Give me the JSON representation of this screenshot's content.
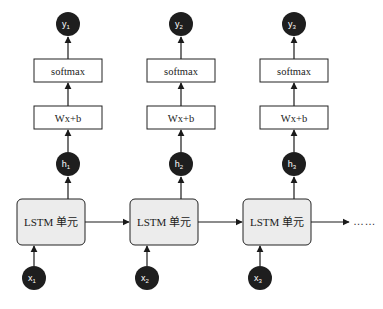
{
  "diagram": {
    "type": "unrolled-lstm-sequence",
    "timesteps": [
      {
        "input": {
          "label": "x",
          "sub": "1"
        },
        "cell": {
          "label": "LSTM 单元"
        },
        "hidden": {
          "label": "h",
          "sub": "1"
        },
        "linear": {
          "label": "Wx+b"
        },
        "softmax": {
          "label": "softmax"
        },
        "output": {
          "label": "y",
          "sub": "1"
        }
      },
      {
        "input": {
          "label": "x",
          "sub": "2"
        },
        "cell": {
          "label": "LSTM 单元"
        },
        "hidden": {
          "label": "h",
          "sub": "2"
        },
        "linear": {
          "label": "Wx+b"
        },
        "softmax": {
          "label": "softmax"
        },
        "output": {
          "label": "y",
          "sub": "2"
        }
      },
      {
        "input": {
          "label": "x",
          "sub": "3"
        },
        "cell": {
          "label": "LSTM 单元"
        },
        "hidden": {
          "label": "h",
          "sub": "3"
        },
        "linear": {
          "label": "Wx+b"
        },
        "softmax": {
          "label": "softmax"
        },
        "output": {
          "label": "y",
          "sub": "3"
        }
      }
    ],
    "continuation": "……",
    "edges": [
      "x1->LSTM1",
      "LSTM1->h1",
      "h1->Wx+b",
      "Wx+b->softmax",
      "softmax->y1",
      "x2->LSTM2",
      "LSTM2->h2",
      "h2->Wx+b",
      "Wx+b->softmax",
      "softmax->y2",
      "x3->LSTM3",
      "LSTM3->h3",
      "h3->Wx+b",
      "Wx+b->softmax",
      "softmax->y3",
      "LSTM1->LSTM2",
      "LSTM2->LSTM3",
      "LSTM3->……"
    ],
    "colors": {
      "node_fill": "#1e1e1e",
      "cell_fill": "#ececec",
      "box_fill": "#ffffff",
      "stroke": "#222222"
    }
  },
  "caption": {
    "visible": "partial",
    "text": ""
  }
}
